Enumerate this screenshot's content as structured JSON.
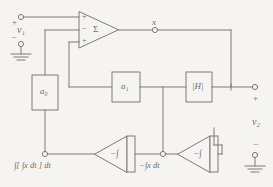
{
  "diagram": {
    "type": "circuit-block-diagram",
    "stroke_color": "#7d7b79",
    "background_color": "#f6f4f1",
    "text_color": "#6f6d6b"
  },
  "input_port": {
    "plus_label": "+",
    "minus_label": "−",
    "source_label": "v₁",
    "ground_name": "input-ground"
  },
  "summer": {
    "name": "summing-amplifier",
    "symbol": "Σ",
    "input_signs": [
      "+",
      "−",
      "+"
    ]
  },
  "nodes": {
    "x_node": "x",
    "first_integral_node": "−∫x dt",
    "double_integral_node": "∫[ ∫x dt ] dt"
  },
  "blocks": [
    {
      "name": "gain-block-a0",
      "label": "a₀"
    },
    {
      "name": "gain-block-a1",
      "label": "a₁"
    },
    {
      "name": "gain-block-H",
      "label": "|H|"
    }
  ],
  "integrators": [
    {
      "name": "integrator-1",
      "label": "−∫"
    },
    {
      "name": "integrator-2",
      "label": "−∫"
    }
  ],
  "output_port": {
    "plus_label": "+",
    "minus_label": "−",
    "signal_label": "v₂",
    "ground_name": "output-ground"
  }
}
